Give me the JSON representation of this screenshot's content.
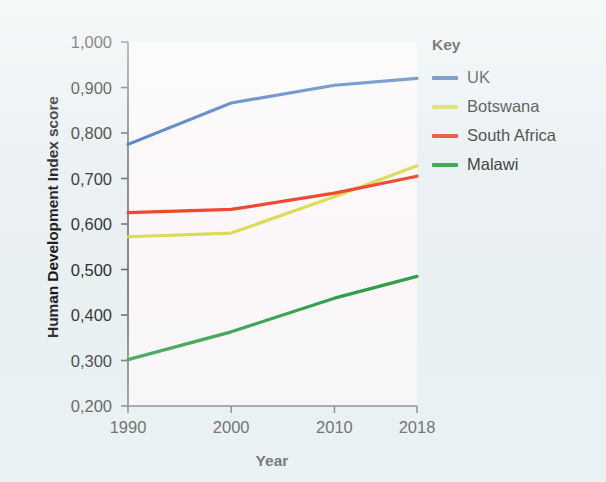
{
  "chart_data": {
    "type": "line",
    "title": "",
    "xlabel": "Year",
    "ylabel": "Human Development Index score",
    "x": [
      1990,
      2000,
      2010,
      2018
    ],
    "x_tick_labels": [
      "1990",
      "2000",
      "2010",
      "2018"
    ],
    "y_tick_labels": [
      "0,200",
      "0,300",
      "0,400",
      "0,500",
      "0,600",
      "0,700",
      "0,800",
      "0,900",
      "1,000"
    ],
    "y_tick_values": [
      0.2,
      0.3,
      0.4,
      0.5,
      0.6,
      0.7,
      0.8,
      0.9,
      1.0
    ],
    "ylim": [
      0.2,
      1.0
    ],
    "xlim": [
      1990,
      2018
    ],
    "grid": false,
    "legend_position": "right",
    "legend_title": "Key",
    "series": [
      {
        "name": "UK",
        "color": "#3a6fb8",
        "values": [
          0.775,
          0.866,
          0.905,
          0.92
        ]
      },
      {
        "name": "Botswana",
        "color": "#d9d94c",
        "values": [
          0.572,
          0.58,
          0.66,
          0.728
        ]
      },
      {
        "name": "South Africa",
        "color": "#ee3b22",
        "values": [
          0.625,
          0.632,
          0.668,
          0.705
        ]
      },
      {
        "name": "Malawi",
        "color": "#2e9e46",
        "values": [
          0.302,
          0.363,
          0.437,
          0.485
        ]
      }
    ]
  },
  "axes": {
    "y_title": "Human Development Index score",
    "x_title": "Year"
  },
  "legend": {
    "title": "Key",
    "items": [
      {
        "label": "UK",
        "color": "#3a6fb8"
      },
      {
        "label": "Botswana",
        "color": "#d9d94c"
      },
      {
        "label": "South Africa",
        "color": "#ee3b22"
      },
      {
        "label": "Malawi",
        "color": "#2e9e46"
      }
    ]
  },
  "colors": {
    "background": "#e9f0f2",
    "plot_background": "#fbf7f9",
    "axis": "#6b6b6b",
    "text": "#2b2b2b"
  }
}
